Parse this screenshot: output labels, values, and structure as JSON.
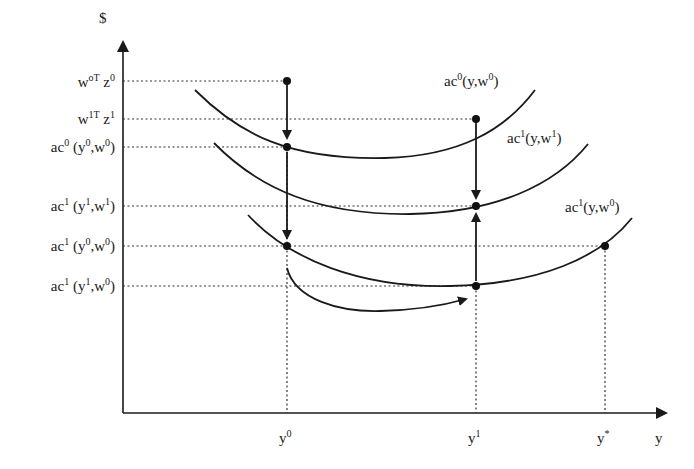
{
  "diagram": {
    "y_axis": {
      "label": "$"
    },
    "x_axis": {
      "label": "y"
    },
    "y_ticks": [
      {
        "base": "w",
        "sup1": "oT",
        "mid": " z",
        "sup2": "0"
      },
      {
        "base": "w",
        "sup1": "1T",
        "mid": " z",
        "sup2": "1"
      },
      {
        "base": "ac",
        "sup1": "0",
        "mid": " (y",
        "sup2": "0",
        "tail": ",w",
        "sup3": "0",
        "end": ")"
      },
      {
        "base": "ac",
        "sup1": "1",
        "mid": " (y",
        "sup2": "1",
        "tail": ",w",
        "sup3": "1",
        "end": ")"
      },
      {
        "base": "ac",
        "sup1": "1",
        "mid": " (y",
        "sup2": "0",
        "tail": ",w",
        "sup3": "0",
        "end": ")"
      },
      {
        "base": "ac",
        "sup1": "1",
        "mid": " (y",
        "sup2": "1",
        "tail": ",w",
        "sup3": "0",
        "end": ")"
      }
    ],
    "x_ticks": [
      {
        "base": "y",
        "sup": "0"
      },
      {
        "base": "y",
        "sup": "1"
      },
      {
        "base": "y",
        "sup": "*"
      }
    ],
    "curves": [
      {
        "name": "ac0-y-w0",
        "label": {
          "base": "ac",
          "sup1": "0",
          "mid": "(y,w",
          "sup2": "0",
          "end": ")"
        }
      },
      {
        "name": "ac1-y-w1",
        "label": {
          "base": "ac",
          "sup1": "1",
          "mid": "(y,w",
          "sup2": "1",
          "end": ")"
        }
      },
      {
        "name": "ac1-y-w0",
        "label": {
          "base": "ac",
          "sup1": "1",
          "mid": "(y,w",
          "sup2": "0",
          "end": ")"
        }
      }
    ]
  }
}
